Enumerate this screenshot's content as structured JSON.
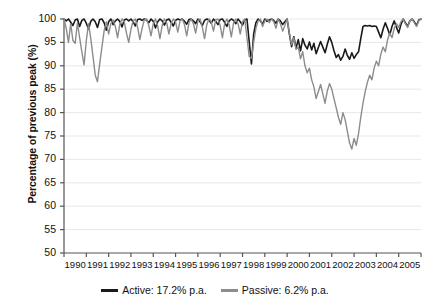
{
  "chart_data": {
    "type": "line",
    "title": "",
    "xlabel": "",
    "ylabel": "Percentage of previous peak (%)",
    "ylim": [
      50,
      100
    ],
    "xlim": [
      1990,
      2006
    ],
    "grid": true,
    "legend_position": "bottom",
    "yticks": [
      50,
      55,
      60,
      65,
      70,
      75,
      80,
      85,
      90,
      95,
      100
    ],
    "xticks": [
      1990,
      1991,
      1992,
      1993,
      1994,
      1995,
      1996,
      1997,
      1998,
      1999,
      2000,
      2001,
      2002,
      2003,
      2004,
      2005
    ],
    "series": [
      {
        "name": "Active: 17.2% p.a.",
        "color": "#1a1a1a",
        "x": [
          1990.0,
          1990.1,
          1990.2,
          1990.3,
          1990.4,
          1990.5,
          1990.6,
          1990.7,
          1990.8,
          1990.9,
          1991.0,
          1991.1,
          1991.2,
          1991.3,
          1991.4,
          1991.5,
          1991.6,
          1991.7,
          1991.8,
          1991.9,
          1992.0,
          1992.1,
          1992.2,
          1992.3,
          1992.4,
          1992.5,
          1992.6,
          1992.7,
          1992.8,
          1992.9,
          1993.0,
          1993.1,
          1993.2,
          1993.3,
          1993.4,
          1993.5,
          1993.6,
          1993.7,
          1993.8,
          1993.9,
          1994.0,
          1994.1,
          1994.2,
          1994.3,
          1994.4,
          1994.5,
          1994.6,
          1994.7,
          1994.8,
          1994.9,
          1995.0,
          1995.1,
          1995.2,
          1995.3,
          1995.4,
          1995.5,
          1995.6,
          1995.7,
          1995.8,
          1995.9,
          1996.0,
          1996.1,
          1996.2,
          1996.3,
          1996.4,
          1996.5,
          1996.6,
          1996.7,
          1996.8,
          1996.9,
          1997.0,
          1997.1,
          1997.2,
          1997.3,
          1997.4,
          1997.5,
          1997.6,
          1997.7,
          1997.8,
          1997.9,
          1998.0,
          1998.1,
          1998.2,
          1998.3,
          1998.4,
          1998.5,
          1998.6,
          1998.7,
          1998.8,
          1998.9,
          1999.0,
          1999.1,
          1999.2,
          1999.3,
          1999.4,
          1999.5,
          1999.6,
          1999.7,
          1999.8,
          1999.9,
          2000.0,
          2000.1,
          2000.2,
          2000.3,
          2000.4,
          2000.5,
          2000.6,
          2000.7,
          2000.8,
          2000.9,
          2001.0,
          2001.1,
          2001.2,
          2001.3,
          2001.4,
          2001.5,
          2001.6,
          2001.7,
          2001.8,
          2001.9,
          2002.0,
          2002.1,
          2002.2,
          2002.3,
          2002.4,
          2002.5,
          2002.6,
          2002.7,
          2002.8,
          2002.9,
          2003.0,
          2003.1,
          2003.2,
          2003.3,
          2003.4,
          2003.5,
          2003.6,
          2003.7,
          2003.8,
          2003.9,
          2004.0,
          2004.1,
          2004.2,
          2004.3,
          2004.4,
          2004.5,
          2004.6,
          2004.7,
          2004.8,
          2004.9,
          2005.0,
          2005.1,
          2005.2,
          2005.3,
          2005.4,
          2005.5,
          2005.6,
          2005.7,
          2005.8,
          2005.9,
          2006.0
        ],
        "values": [
          100,
          99.6,
          100,
          99.3,
          98.6,
          99.8,
          100,
          98.4,
          99.7,
          100,
          99.1,
          97.8,
          99.5,
          100,
          99.4,
          98.2,
          99.9,
          100,
          99.2,
          97.6,
          99.4,
          100,
          98.8,
          99.6,
          100,
          99.5,
          98.3,
          99.8,
          100,
          99.6,
          100,
          99.4,
          98.5,
          99.9,
          100,
          99.7,
          100,
          99.8,
          99.2,
          100,
          99.5,
          98.1,
          99.4,
          100,
          99.6,
          98.7,
          99.8,
          100,
          99.3,
          98.5,
          99.7,
          100,
          99.8,
          100,
          99.5,
          98.9,
          99.9,
          100,
          99.6,
          99.0,
          100,
          99.4,
          98.6,
          99.7,
          100,
          99.8,
          99.1,
          100,
          99.5,
          98.8,
          99.9,
          100,
          99.3,
          98.4,
          99.6,
          100,
          99.7,
          99.0,
          100,
          99.4,
          98.7,
          99.8,
          100,
          95.2,
          90.4,
          96.8,
          99.2,
          100,
          99.6,
          98.9,
          100,
          99.5,
          99.8,
          100,
          99.7,
          99.1,
          100,
          99.6,
          98.8,
          99.4,
          100,
          96.8,
          94.1,
          96.2,
          93.8,
          95.6,
          93.2,
          95.8,
          94.4,
          93.6,
          95.1,
          93.4,
          94.8,
          92.6,
          93.9,
          95.2,
          94.0,
          92.8,
          94.6,
          96.2,
          95.0,
          93.2,
          91.8,
          92.4,
          91.2,
          92.0,
          93.6,
          92.2,
          91.4,
          92.8,
          91.6,
          92.4,
          93.0,
          95.8,
          98.4,
          98.6,
          98.5,
          98.6,
          98.4,
          98.5,
          98.4,
          97.2,
          96.0,
          97.8,
          99.2,
          98.0,
          96.6,
          98.4,
          99.6,
          98.2,
          97.0,
          98.8,
          100,
          99.2,
          98.4,
          99.6,
          100,
          99.4,
          98.6,
          99.8,
          100
        ]
      },
      {
        "name": "Passive: 6.2% p.a.",
        "color": "#8c8c8c",
        "x": [
          1990.0,
          1990.1,
          1990.2,
          1990.3,
          1990.4,
          1990.5,
          1990.6,
          1990.7,
          1990.8,
          1990.9,
          1991.0,
          1991.1,
          1991.2,
          1991.3,
          1991.4,
          1991.5,
          1991.6,
          1991.7,
          1991.8,
          1991.9,
          1992.0,
          1992.1,
          1992.2,
          1992.3,
          1992.4,
          1992.5,
          1992.6,
          1992.7,
          1992.8,
          1992.9,
          1993.0,
          1993.1,
          1993.2,
          1993.3,
          1993.4,
          1993.5,
          1993.6,
          1993.7,
          1993.8,
          1993.9,
          1994.0,
          1994.1,
          1994.2,
          1994.3,
          1994.4,
          1994.5,
          1994.6,
          1994.7,
          1994.8,
          1994.9,
          1995.0,
          1995.1,
          1995.2,
          1995.3,
          1995.4,
          1995.5,
          1995.6,
          1995.7,
          1995.8,
          1995.9,
          1996.0,
          1996.1,
          1996.2,
          1996.3,
          1996.4,
          1996.5,
          1996.6,
          1996.7,
          1996.8,
          1996.9,
          1997.0,
          1997.1,
          1997.2,
          1997.3,
          1997.4,
          1997.5,
          1997.6,
          1997.7,
          1997.8,
          1997.9,
          1998.0,
          1998.1,
          1998.2,
          1998.3,
          1998.4,
          1998.5,
          1998.6,
          1998.7,
          1998.8,
          1998.9,
          1999.0,
          1999.1,
          1999.2,
          1999.3,
          1999.4,
          1999.5,
          1999.6,
          1999.7,
          1999.8,
          1999.9,
          2000.0,
          2000.1,
          2000.2,
          2000.3,
          2000.4,
          2000.5,
          2000.6,
          2000.7,
          2000.8,
          2000.9,
          2001.0,
          2001.1,
          2001.2,
          2001.3,
          2001.4,
          2001.5,
          2001.6,
          2001.7,
          2001.8,
          2001.9,
          2002.0,
          2002.1,
          2002.2,
          2002.3,
          2002.4,
          2002.5,
          2002.6,
          2002.7,
          2002.8,
          2002.9,
          2003.0,
          2003.1,
          2003.2,
          2003.3,
          2003.4,
          2003.5,
          2003.6,
          2003.7,
          2003.8,
          2003.9,
          2004.0,
          2004.1,
          2004.2,
          2004.3,
          2004.4,
          2004.5,
          2004.6,
          2004.7,
          2004.8,
          2004.9,
          2005.0,
          2005.1,
          2005.2,
          2005.3,
          2005.4,
          2005.5,
          2005.6,
          2005.7,
          2005.8,
          2005.9,
          2006.0
        ],
        "values": [
          100,
          98.0,
          95.0,
          99.0,
          95.4,
          94.8,
          99.2,
          96.0,
          93.0,
          90.2,
          95.4,
          99.0,
          95.8,
          92.0,
          88.0,
          86.6,
          90.4,
          94.0,
          97.5,
          99.4,
          96.8,
          99.0,
          99.8,
          98.4,
          96.0,
          98.8,
          100,
          99.4,
          97.0,
          95.0,
          97.8,
          99.6,
          100,
          98.2,
          95.6,
          98.0,
          99.8,
          100,
          98.6,
          96.4,
          99.0,
          100,
          98.4,
          95.8,
          98.6,
          100,
          99.2,
          96.8,
          99.0,
          100,
          99.4,
          97.2,
          99.6,
          100,
          98.8,
          96.4,
          99.2,
          100,
          99.0,
          97.0,
          99.6,
          100,
          98.2,
          95.8,
          98.8,
          100,
          99.4,
          97.4,
          99.8,
          100,
          98.6,
          96.0,
          99.0,
          100,
          98.8,
          96.2,
          99.2,
          100,
          99.0,
          96.8,
          99.4,
          100,
          96.0,
          92.0,
          91.6,
          95.0,
          98.0,
          99.6,
          100,
          98.4,
          99.6,
          100,
          99.2,
          100,
          99.4,
          98.0,
          100,
          99.0,
          97.4,
          98.6,
          100,
          97.0,
          94.5,
          96.0,
          93.5,
          94.0,
          91.5,
          93.0,
          90.0,
          88.5,
          89.5,
          87.0,
          85.5,
          83.0,
          84.5,
          86.0,
          84.0,
          82.0,
          84.6,
          86.2,
          85.0,
          83.0,
          81.0,
          79.0,
          77.5,
          80.0,
          78.5,
          76.0,
          73.5,
          72.2,
          74.5,
          73.0,
          75.5,
          79.0,
          82.0,
          84.5,
          86.5,
          88.0,
          87.0,
          89.5,
          91.0,
          90.0,
          92.5,
          94.0,
          93.0,
          95.5,
          97.0,
          96.0,
          98.0,
          99.0,
          98.2,
          99.4,
          100,
          99.0,
          98.2,
          99.6,
          100,
          99.2,
          98.4,
          99.6,
          100
        ]
      }
    ]
  },
  "legend": {
    "entries": [
      {
        "label": "Active: 17.2% p.a.",
        "color": "#1a1a1a"
      },
      {
        "label": "Passive: 6.2% p.a.",
        "color": "#8c8c8c"
      }
    ]
  },
  "axis": {
    "y_title": "Percentage of previous peak (%)"
  }
}
